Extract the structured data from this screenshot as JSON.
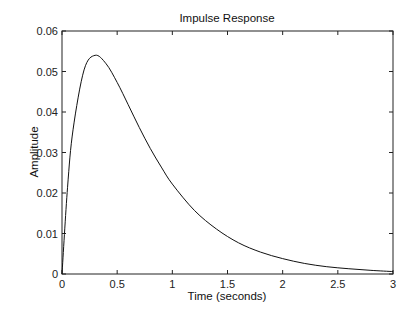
{
  "chart_data": {
    "type": "line",
    "title": "Impulse Response",
    "xlabel": "Time (seconds)",
    "ylabel": "Amplitude",
    "xlim": [
      0,
      3
    ],
    "ylim": [
      0,
      0.06
    ],
    "xticks": [
      "0",
      "0.5",
      "1",
      "1.5",
      "2",
      "2.5",
      "3"
    ],
    "xtick_values": [
      0,
      0.5,
      1,
      1.5,
      2,
      2.5,
      3
    ],
    "yticks": [
      "0",
      "0.01",
      "0.02",
      "0.03",
      "0.04",
      "0.05",
      "0.06"
    ],
    "ytick_values": [
      0,
      0.01,
      0.02,
      0.03,
      0.04,
      0.05,
      0.06
    ],
    "grid": false,
    "series": [
      {
        "name": "impulse response",
        "color": "#111111",
        "x": [
          0,
          0.05,
          0.1,
          0.2,
          0.3,
          0.4,
          0.5,
          0.6,
          0.7,
          0.8,
          0.9,
          1.0,
          1.2,
          1.4,
          1.6,
          1.8,
          2.0,
          2.2,
          2.4,
          2.6,
          2.8,
          3.0
        ],
        "y": [
          0,
          0.0213,
          0.0356,
          0.0504,
          0.054,
          0.0519,
          0.0473,
          0.0418,
          0.0362,
          0.031,
          0.0264,
          0.0222,
          0.0157,
          0.0111,
          0.0077,
          0.0054,
          0.0038,
          0.0026,
          0.0018,
          0.0013,
          0.0009,
          0.0006
        ]
      }
    ]
  }
}
